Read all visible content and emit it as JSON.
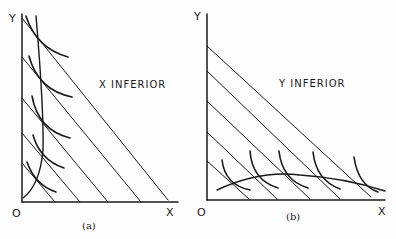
{
  "panels": [
    {
      "id": "a",
      "title": "X INFERIOR",
      "caption": "(a)",
      "y_axis_label": "Y",
      "x_axis_label": "X",
      "origin_label": "O"
    },
    {
      "id": "b",
      "title": "Y INFERIOR",
      "caption": "(b)",
      "y_axis_label": "Y",
      "x_axis_label": "X",
      "origin_label": "O"
    }
  ],
  "colors": {
    "ink": "#1a1a1a",
    "paper": "#fdfdfd"
  }
}
